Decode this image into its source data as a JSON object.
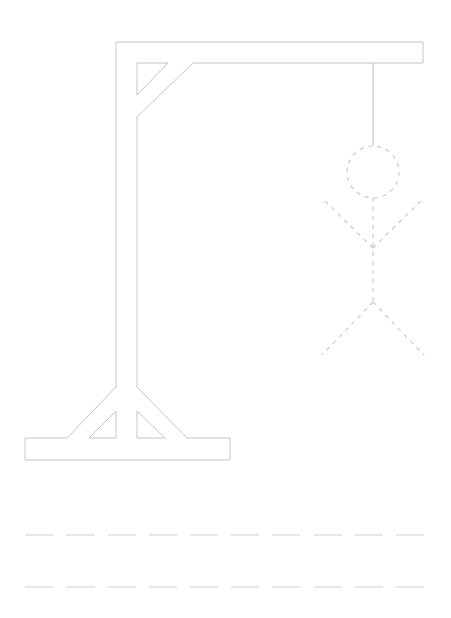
{
  "game": {
    "name": "Hangman",
    "colors": {
      "gallows_stroke": "#c6c6c6",
      "rope_stroke": "#b8b8b8",
      "figure_stroke": "#c9c9c9",
      "blank_stroke": "#cfcfcf",
      "background": "#ffffff"
    },
    "figure": {
      "style": "dashed-outline",
      "parts": [
        "head",
        "body",
        "left-arm",
        "right-arm",
        "left-leg",
        "right-leg"
      ]
    },
    "word_rows": [
      {
        "row": 1,
        "blanks": [
          "",
          "",
          "",
          "",
          "",
          "",
          "",
          "",
          "",
          ""
        ]
      },
      {
        "row": 2,
        "blanks": [
          "",
          "",
          "",
          "",
          "",
          "",
          "",
          "",
          "",
          ""
        ]
      }
    ]
  }
}
